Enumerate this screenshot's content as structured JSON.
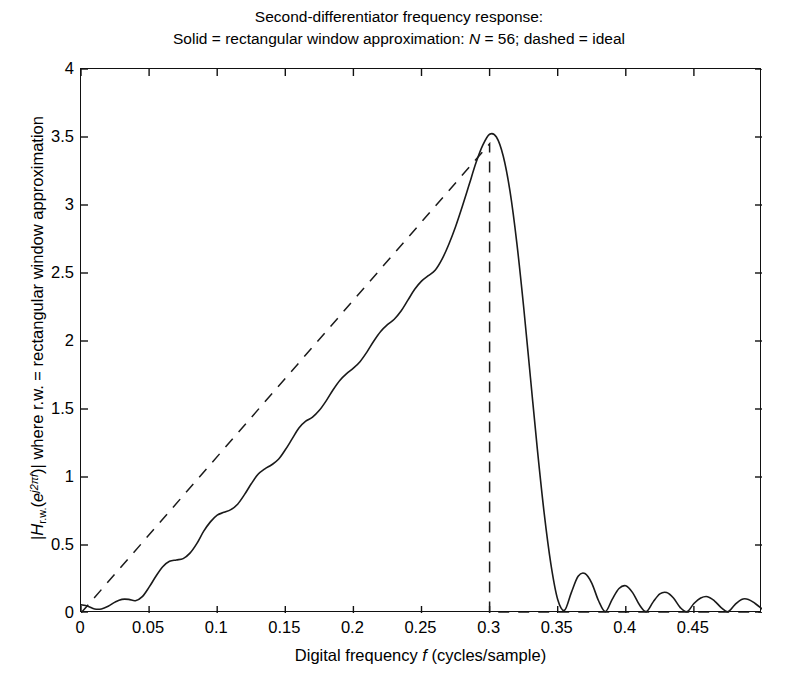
{
  "chart_data": {
    "type": "line",
    "title": "Second-differentiator frequency response:",
    "subtitle_parts": {
      "a": "Solid = rectangular window approximation: ",
      "n": "N",
      "b": " = 56; dashed = ideal"
    },
    "title_full": "Second-differentiator frequency response: Solid = rectangular window approximation: N = 56; dashed = ideal",
    "xlabel_parts": {
      "a": "Digital frequency ",
      "f": "f",
      "b": " (cycles/sample)"
    },
    "xlabel": "Digital frequency f (cycles/sample)",
    "ylabel_parts": {
      "bar1": "|",
      "H": "H",
      "sub": "r.w.",
      "open": "(",
      "e": "e",
      "exp": "j2πf",
      "close": ")",
      "bar2": "|",
      "rest": " where r.w. = rectangular window approximation"
    },
    "ylabel": "|H r.w. (e^{j2πf})| where r.w. = rectangular window approximation",
    "grid": false,
    "legend": "none",
    "legend_entries": [
      {
        "name": "rectangular window approximation",
        "style": "solid"
      },
      {
        "name": "ideal",
        "style": "dashed"
      }
    ],
    "xlim": [
      0,
      0.5
    ],
    "ylim": [
      0,
      4
    ],
    "xticks": [
      0,
      0.05,
      0.1,
      0.15,
      0.2,
      0.25,
      0.3,
      0.35,
      0.4,
      0.45
    ],
    "xtick_labels": [
      "0",
      "0.05",
      "0.1",
      "0.15",
      "0.2",
      "0.25",
      "0.3",
      "0.35",
      "0.4",
      "0.45"
    ],
    "yticks": [
      0,
      0.5,
      1,
      1.5,
      2,
      2.5,
      3,
      3.5,
      4
    ],
    "ytick_labels": [
      "0",
      "0.5",
      "1",
      "1.5",
      "2",
      "2.5",
      "3",
      "3.5",
      "4"
    ],
    "filter_length_N": 56,
    "band_edge_f": 0.3,
    "ideal_slope": 11.5,
    "peak": {
      "x": 0.283,
      "y": 3.54
    },
    "series": [
      {
        "name": "ideal",
        "style": "dashed",
        "color": "#1a1a1a",
        "x": [
          0,
          0.3,
          0.3,
          0.5
        ],
        "y": [
          0,
          3.45,
          0,
          0
        ]
      },
      {
        "name": "rectangular window approximation",
        "style": "solid",
        "color": "#1a1a1a",
        "x": [
          0.0,
          0.005,
          0.01,
          0.015,
          0.02,
          0.025,
          0.03,
          0.035,
          0.04,
          0.045,
          0.05,
          0.055,
          0.06,
          0.065,
          0.07,
          0.075,
          0.08,
          0.085,
          0.09,
          0.095,
          0.1,
          0.105,
          0.11,
          0.115,
          0.12,
          0.125,
          0.13,
          0.135,
          0.14,
          0.145,
          0.15,
          0.155,
          0.16,
          0.165,
          0.17,
          0.175,
          0.18,
          0.185,
          0.19,
          0.195,
          0.2,
          0.205,
          0.21,
          0.215,
          0.22,
          0.225,
          0.23,
          0.235,
          0.24,
          0.245,
          0.25,
          0.255,
          0.26,
          0.265,
          0.27,
          0.275,
          0.28,
          0.285,
          0.29,
          0.295,
          0.3,
          0.305,
          0.31,
          0.315,
          0.32,
          0.325,
          0.33,
          0.335,
          0.34,
          0.345,
          0.35,
          0.355,
          0.36,
          0.365,
          0.37,
          0.375,
          0.38,
          0.385,
          0.39,
          0.395,
          0.4,
          0.405,
          0.41,
          0.415,
          0.42,
          0.425,
          0.43,
          0.435,
          0.44,
          0.445,
          0.45,
          0.455,
          0.46,
          0.465,
          0.47,
          0.475,
          0.48,
          0.485,
          0.49,
          0.495,
          0.5
        ],
        "y": [
          0.06,
          0.05,
          0.03,
          0.03,
          0.05,
          0.08,
          0.1,
          0.1,
          0.09,
          0.12,
          0.19,
          0.27,
          0.34,
          0.38,
          0.39,
          0.4,
          0.44,
          0.51,
          0.6,
          0.67,
          0.72,
          0.74,
          0.76,
          0.8,
          0.87,
          0.95,
          1.02,
          1.06,
          1.09,
          1.13,
          1.2,
          1.28,
          1.36,
          1.41,
          1.44,
          1.49,
          1.56,
          1.64,
          1.71,
          1.76,
          1.8,
          1.85,
          1.92,
          2.0,
          2.07,
          2.12,
          2.16,
          2.22,
          2.3,
          2.38,
          2.44,
          2.48,
          2.52,
          2.6,
          2.71,
          2.84,
          2.99,
          3.15,
          3.31,
          3.44,
          3.52,
          3.5,
          3.36,
          3.1,
          2.72,
          2.25,
          1.73,
          1.21,
          0.74,
          0.36,
          0.1,
          0.02,
          0.15,
          0.27,
          0.29,
          0.22,
          0.09,
          0.01,
          0.1,
          0.18,
          0.2,
          0.15,
          0.06,
          0.01,
          0.08,
          0.14,
          0.15,
          0.11,
          0.04,
          0.01,
          0.07,
          0.11,
          0.12,
          0.09,
          0.04,
          0.01,
          0.06,
          0.1,
          0.1,
          0.07,
          0.03
        ],
        "note": "truncated-sinc (rectangular window) approximation showing Gibbs ripples around the ideal ramp and decaying sidelobes in the stopband"
      }
    ]
  },
  "axes": {
    "x_tick_count": 10,
    "y_tick_count": 9,
    "box": "on"
  }
}
